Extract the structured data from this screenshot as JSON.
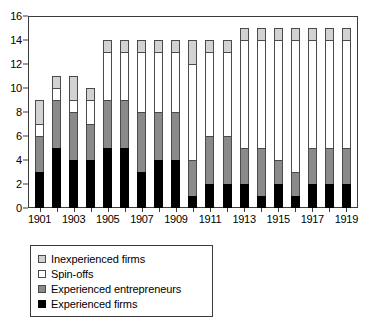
{
  "chart_data": {
    "type": "bar",
    "subtype": "stacked-vertical",
    "title": "",
    "subtitle": "",
    "xlabel": "",
    "ylabel": "",
    "ylim": [
      0,
      16
    ],
    "y_ticks": [
      0,
      2,
      4,
      6,
      8,
      10,
      12,
      14,
      16
    ],
    "grid": false,
    "legend_position": "below-plot-left",
    "categories": [
      "1901",
      "1902",
      "1903",
      "1904",
      "1905",
      "1906",
      "1907",
      "1908",
      "1909",
      "1910",
      "1911",
      "1912",
      "1913",
      "1914",
      "1915",
      "1916",
      "1917",
      "1918",
      "1919"
    ],
    "x_tick_labels_shown": [
      "1901",
      "1903",
      "1905",
      "1907",
      "1909",
      "1911",
      "1913",
      "1915",
      "1917",
      "1919"
    ],
    "series": [
      {
        "name": "Experienced firms",
        "color": "#000000",
        "values": [
          3,
          5,
          4,
          4,
          5,
          5,
          3,
          4,
          4,
          1,
          2,
          2,
          2,
          1,
          2,
          1,
          2,
          2,
          2
        ]
      },
      {
        "name": "Experienced entrepreneurs",
        "color": "#8a8a8a",
        "values": [
          3,
          4,
          4,
          3,
          4,
          4,
          5,
          4,
          4,
          3,
          4,
          4,
          3,
          4,
          2,
          2,
          3,
          3,
          3
        ]
      },
      {
        "name": "Spin-offs",
        "color": "#ffffff",
        "values": [
          1,
          1,
          1,
          2,
          4,
          4,
          5,
          5,
          5,
          8,
          7,
          7,
          9,
          9,
          10,
          11,
          9,
          9,
          9
        ]
      },
      {
        "name": "Inexperienced firms",
        "color": "#d2d2d2",
        "values": [
          2,
          1,
          2,
          1,
          1,
          1,
          1,
          1,
          1,
          2,
          1,
          1,
          1,
          1,
          1,
          1,
          1,
          1,
          1
        ]
      }
    ],
    "totals": [
      9,
      11,
      11,
      10,
      14,
      14,
      14,
      14,
      14,
      14,
      14,
      14,
      15,
      15,
      15,
      15,
      15,
      15,
      15
    ]
  },
  "legend": {
    "items": [
      {
        "label": "Inexperienced firms",
        "swatch": "light-gray-swatch"
      },
      {
        "label": "Spin-offs",
        "swatch": "white-swatch"
      },
      {
        "label": "Experienced entrepreneurs",
        "swatch": "gray-swatch"
      },
      {
        "label": "Experienced firms",
        "swatch": "black-swatch"
      }
    ]
  }
}
